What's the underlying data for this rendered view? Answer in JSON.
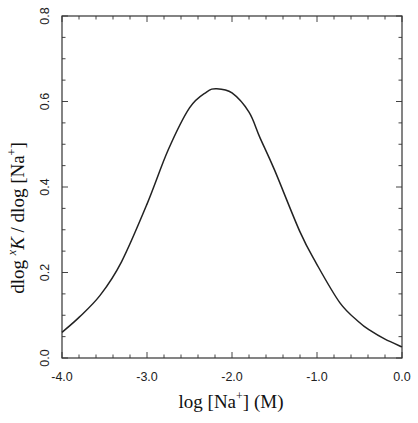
{
  "chart_data": {
    "type": "line",
    "title": "",
    "xlabel": "log [Na+]  (M)",
    "ylabel": "dlog xK / dlog [Na+]",
    "xlim": [
      -4.0,
      0.0
    ],
    "ylim": [
      0.0,
      0.8
    ],
    "x_ticks": [
      -4.0,
      -3.0,
      -2.0,
      -1.0,
      0.0
    ],
    "x_tick_labels": [
      "-4.0",
      "-3.0",
      "-2.0",
      "-1.0",
      "0.0"
    ],
    "x_minor_step": 0.2,
    "y_ticks": [
      0.0,
      0.2,
      0.4,
      0.6,
      0.8
    ],
    "y_tick_labels": [
      "0.0",
      "0.2",
      "0.4",
      "0.6",
      "0.8"
    ],
    "y_minor_step": 0.05,
    "grid": false,
    "legend": null,
    "series": [
      {
        "name": "dlog xK / dlog [Na+]",
        "color": "#222222",
        "x": [
          -4.0,
          -3.8,
          -3.55,
          -3.3,
          -3.0,
          -2.75,
          -2.5,
          -2.3,
          -2.18,
          -2.0,
          -1.8,
          -1.67,
          -1.5,
          -1.2,
          -1.01,
          -0.73,
          -0.5,
          -0.38,
          -0.2,
          0.0
        ],
        "y": [
          0.06,
          0.095,
          0.147,
          0.225,
          0.36,
          0.487,
          0.585,
          0.622,
          0.63,
          0.62,
          0.575,
          0.515,
          0.44,
          0.295,
          0.222,
          0.129,
          0.083,
          0.065,
          0.044,
          0.026
        ]
      }
    ]
  },
  "labels": {
    "x_axis": {
      "main": "log [Na",
      "sup": "+",
      "tail": "]  (M)"
    },
    "y_axis": {
      "pre": "dlog ",
      "sup": "x",
      "k": "K",
      "mid": " / dlog [Na",
      "sup2": "+",
      "tail": "]"
    }
  }
}
